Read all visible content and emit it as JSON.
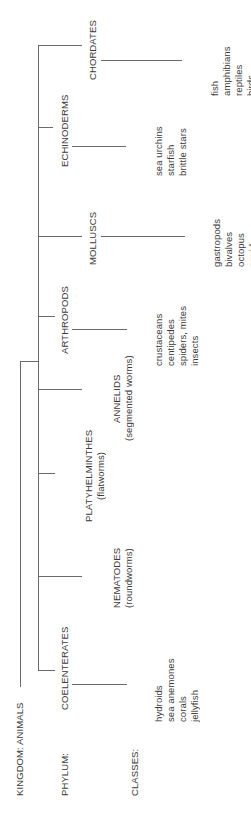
{
  "diagram": {
    "title": "KINGDOM: ANIMALS",
    "row_labels": {
      "phylum": "PHYLUM:",
      "classes": "CLASSES:"
    },
    "colors": {
      "line": "#6a6a6a",
      "text": "#3a3a3a",
      "background": "#ffffff"
    },
    "phyla": [
      {
        "name": "COELENTERATES",
        "common": "",
        "classes": [
          "hydroids",
          "sea anemones",
          "corals",
          "jellyfish"
        ]
      },
      {
        "name": "NEMATODES",
        "common": "(roundworms)",
        "classes": []
      },
      {
        "name": "PLATYHELMINTHES",
        "common": "(flatworms)",
        "classes": []
      },
      {
        "name": "ANNELIDS",
        "common": "(segmented worms)",
        "classes": []
      },
      {
        "name": "ARTHROPODS",
        "common": "",
        "classes": [
          "crustaceans",
          "centipedes",
          "spiders, mites",
          "insects"
        ]
      },
      {
        "name": "MOLLUSCS",
        "common": "",
        "classes": [
          "gastropods",
          "bivalves",
          "octopus",
          "squid"
        ]
      },
      {
        "name": "ECHINODERMS",
        "common": "",
        "classes": [
          "sea urchins",
          "starfish",
          "brittle stars"
        ]
      },
      {
        "name": "CHORDATES",
        "common": "",
        "classes": [
          "fish",
          "amphibians",
          "reptiles",
          "birds",
          "mammals"
        ]
      }
    ]
  }
}
